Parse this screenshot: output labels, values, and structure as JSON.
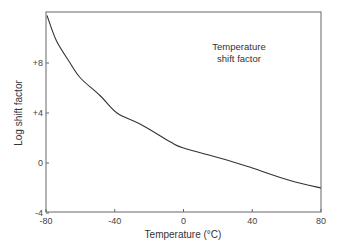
{
  "chart_data": {
    "type": "line",
    "title": "",
    "annotation": [
      "Temperature",
      "shift factor"
    ],
    "xlabel": "Temperature (°C)",
    "ylabel": "Log shift factor",
    "xlim": [
      -80,
      80
    ],
    "ylim": [
      -4,
      12.2
    ],
    "xticks": [
      -80,
      -40,
      0,
      40,
      80
    ],
    "xtick_labels": [
      "-80",
      "-40",
      "0",
      "40",
      "80"
    ],
    "yticks": [
      -4,
      0,
      4,
      8
    ],
    "ytick_labels": [
      "-4",
      "0",
      "+4",
      "+8"
    ],
    "grid": false,
    "legend": null,
    "series": [
      {
        "name": "Temperature shift factor",
        "color": "#333333",
        "x": [
          -79.4,
          -74,
          -66,
          -60,
          -48.6,
          -38.7,
          -25,
          -7.8,
          0,
          21,
          40,
          62,
          80
        ],
        "y": [
          11.8,
          9.8,
          8.0,
          6.8,
          5.4,
          4.0,
          3.1,
          1.7,
          1.2,
          0.4,
          -0.4,
          -1.4,
          -2.0
        ]
      }
    ]
  },
  "colors": {
    "axis": "#555555",
    "line": "#333333",
    "background": "#ffffff"
  }
}
